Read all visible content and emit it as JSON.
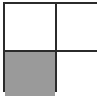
{
  "figure": {
    "name": "two-by-two-grid",
    "rows": 2,
    "columns": 2,
    "background_color": "#ffffff",
    "border_color": "#2b2b2b",
    "border_width_px": 2,
    "fill_color": "#9a9a9a",
    "empty_color": "#ffffff",
    "cells": [
      {
        "id": "cell-top-left",
        "row": 1,
        "column": 1,
        "state": "empty",
        "color": "#ffffff"
      },
      {
        "id": "cell-top-right",
        "row": 1,
        "column": 2,
        "state": "empty",
        "color": "#ffffff"
      },
      {
        "id": "cell-bottom-left",
        "row": 2,
        "column": 1,
        "state": "filled",
        "color": "#9a9a9a"
      },
      {
        "id": "cell-bottom-right",
        "row": 2,
        "column": 2,
        "state": "empty",
        "color": "#ffffff"
      }
    ]
  }
}
